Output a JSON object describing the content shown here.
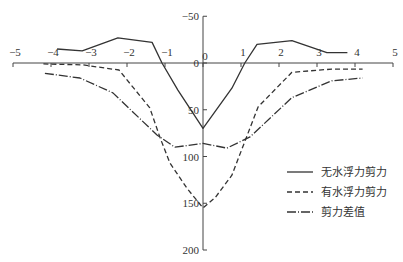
{
  "chart_data": {
    "type": "line",
    "title": "",
    "xlabel": "",
    "ylabel": "",
    "xlim": [
      -5,
      5
    ],
    "ylim": [
      200,
      -50
    ],
    "y_inverted": true,
    "grid": false,
    "x_ticks": [
      -5,
      -4,
      -3,
      -2,
      -1,
      0,
      1,
      2,
      3,
      4,
      5
    ],
    "y_ticks": [
      -50,
      0,
      50,
      100,
      150,
      200
    ],
    "legend_position": "lower-right",
    "series": [
      {
        "name": "无水浮力剪力",
        "style": "solid",
        "points": [
          [
            -3.84,
            -15
          ],
          [
            -3.18,
            -13
          ],
          [
            -2.24,
            -27
          ],
          [
            -1.34,
            -22
          ],
          [
            -1.08,
            0
          ],
          [
            -0.66,
            29
          ],
          [
            0,
            70
          ],
          [
            0.76,
            27
          ],
          [
            1.1,
            0
          ],
          [
            1.42,
            -20
          ],
          [
            2.34,
            -24
          ],
          [
            3.26,
            -11
          ],
          [
            3.8,
            -11
          ]
        ]
      },
      {
        "name": "有水浮力剪力",
        "style": "dashed",
        "points": [
          [
            -4.2,
            1
          ],
          [
            -3.16,
            2
          ],
          [
            -2.21,
            7.5
          ],
          [
            -1.4,
            48
          ],
          [
            -1.13,
            80
          ],
          [
            -0.87,
            107
          ],
          [
            -0.42,
            134
          ],
          [
            0,
            155
          ],
          [
            0.32,
            144
          ],
          [
            0.76,
            120
          ],
          [
            1.45,
            47
          ],
          [
            2.34,
            10
          ],
          [
            3.39,
            6.5
          ],
          [
            4.2,
            6.5
          ]
        ]
      },
      {
        "name": "剪力差值",
        "style": "dashdot",
        "points": [
          [
            -4.16,
            11
          ],
          [
            -3.24,
            16
          ],
          [
            -2.37,
            32
          ],
          [
            -1.21,
            77
          ],
          [
            -0.74,
            90
          ],
          [
            0,
            86
          ],
          [
            0.63,
            91
          ],
          [
            1.24,
            79
          ],
          [
            2.34,
            37
          ],
          [
            3.39,
            19
          ],
          [
            4.2,
            16
          ]
        ]
      }
    ]
  },
  "legend": {
    "items": [
      {
        "label": "无水浮力剪力",
        "style": "solid"
      },
      {
        "label": "有水浮力剪力",
        "style": "dashed"
      },
      {
        "label": "剪力差值",
        "style": "dashdot"
      }
    ]
  },
  "axis_labels": {
    "x": [
      "−5",
      "−4",
      "−3",
      "−2",
      "−1",
      "0",
      "1",
      "2",
      "3",
      "4",
      "5"
    ],
    "y": [
      "−50",
      "0",
      "50",
      "100",
      "150",
      "200"
    ]
  }
}
